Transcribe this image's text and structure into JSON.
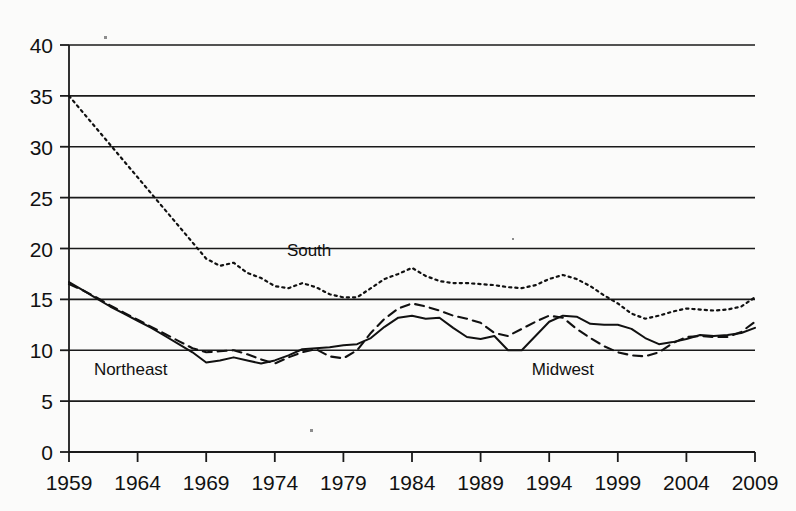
{
  "chart_data": {
    "type": "line",
    "title": "",
    "subtitle": "",
    "xlabel": "",
    "ylabel": "",
    "xlim": [
      1959,
      2009
    ],
    "ylim": [
      0,
      40
    ],
    "grid": true,
    "grid_axis": "y",
    "legend_position": "inline-annotations",
    "x_tick_labels": [
      "1959",
      "1964",
      "1969",
      "1974",
      "1979",
      "1984",
      "1989",
      "1994",
      "1999",
      "2004",
      "2009"
    ],
    "x_tick_values": [
      1959,
      1964,
      1969,
      1974,
      1979,
      1984,
      1989,
      1994,
      1999,
      2004,
      2009
    ],
    "y_tick_labels": [
      "0",
      "5",
      "10",
      "15",
      "20",
      "25",
      "30",
      "35",
      "40"
    ],
    "y_tick_values": [
      0,
      5,
      10,
      15,
      20,
      25,
      30,
      35,
      40
    ],
    "x": [
      1959,
      1960,
      1961,
      1962,
      1963,
      1964,
      1965,
      1966,
      1967,
      1968,
      1969,
      1970,
      1971,
      1972,
      1973,
      1974,
      1975,
      1976,
      1977,
      1978,
      1979,
      1980,
      1981,
      1982,
      1983,
      1984,
      1985,
      1986,
      1987,
      1988,
      1989,
      1990,
      1991,
      1992,
      1993,
      1994,
      1995,
      1996,
      1997,
      1998,
      1999,
      2000,
      2001,
      2002,
      2003,
      2004,
      2005,
      2006,
      2007,
      2008,
      2009
    ],
    "series": [
      {
        "name": "South",
        "linestyle": "dotted",
        "color": "#111111",
        "values": [
          35.0,
          33.4,
          31.8,
          30.2,
          28.6,
          27.0,
          25.4,
          23.8,
          22.2,
          20.6,
          19.0,
          18.3,
          18.6,
          17.6,
          17.1,
          16.3,
          16.1,
          16.6,
          16.2,
          15.5,
          15.2,
          15.2,
          16.1,
          17.0,
          17.5,
          18.1,
          17.3,
          16.8,
          16.6,
          16.6,
          16.5,
          16.4,
          16.2,
          16.1,
          16.4,
          17.0,
          17.4,
          17.0,
          16.3,
          15.4,
          14.6,
          13.6,
          13.1,
          13.4,
          13.8,
          14.1,
          14.0,
          13.9,
          14.0,
          14.3,
          15.2
        ]
      },
      {
        "name": "Midwest",
        "linestyle": "dashed",
        "color": "#111111",
        "values": [
          16.5,
          15.9,
          15.2,
          14.4,
          13.7,
          13.0,
          12.3,
          11.6,
          10.9,
          10.2,
          9.8,
          9.9,
          10.0,
          9.6,
          9.1,
          8.7,
          9.3,
          9.8,
          10.1,
          9.4,
          9.2,
          10.0,
          11.7,
          13.1,
          14.1,
          14.6,
          14.3,
          13.9,
          13.4,
          13.1,
          12.7,
          11.7,
          11.4,
          12.1,
          12.8,
          13.4,
          13.2,
          12.1,
          11.2,
          10.4,
          9.8,
          9.5,
          9.4,
          9.8,
          10.7,
          11.3,
          11.4,
          11.3,
          11.3,
          11.8,
          12.8
        ]
      },
      {
        "name": "Northeast",
        "linestyle": "solid",
        "color": "#111111",
        "values": [
          16.7,
          15.9,
          15.1,
          14.3,
          13.6,
          12.9,
          12.2,
          11.4,
          10.6,
          9.8,
          8.8,
          9.0,
          9.3,
          9.0,
          8.7,
          9.0,
          9.5,
          10.1,
          10.2,
          10.3,
          10.5,
          10.6,
          11.2,
          12.3,
          13.2,
          13.4,
          13.1,
          13.2,
          12.2,
          11.3,
          11.1,
          11.4,
          10.0,
          10.0,
          11.4,
          12.8,
          13.4,
          13.3,
          12.6,
          12.5,
          12.5,
          12.1,
          11.2,
          10.6,
          10.8,
          11.1,
          11.5,
          11.4,
          11.5,
          11.7,
          12.2
        ]
      }
    ],
    "annotations": [
      {
        "text": "South",
        "x": 1976.5,
        "y": 19.3
      },
      {
        "text": "Northeast",
        "x": 1963.5,
        "y": 7.6
      },
      {
        "text": "Midwest",
        "x": 1995.0,
        "y": 7.6
      }
    ]
  }
}
